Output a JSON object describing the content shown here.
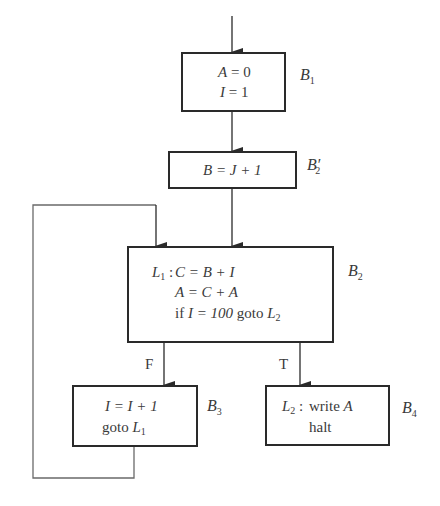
{
  "diagram": {
    "type": "control-flow-graph",
    "blocks": [
      {
        "id": "B1",
        "label": {
          "base": "B",
          "sub": "1",
          "prime": ""
        },
        "lines": [
          {
            "lhs": "A",
            "op": " = ",
            "rhs": "0"
          },
          {
            "lhs": "I",
            "op": " = ",
            "rhs": "1"
          }
        ]
      },
      {
        "id": "B2prime",
        "label": {
          "base": "B",
          "sub": "2",
          "prime": "′"
        },
        "lines": [
          {
            "text": "B = J + 1"
          }
        ]
      },
      {
        "id": "B2",
        "label": {
          "base": "B",
          "sub": "2",
          "prime": ""
        },
        "entry_label": {
          "base": "L",
          "sub": "1",
          "sep": " : "
        },
        "lines": [
          {
            "text": "C = B + I"
          },
          {
            "text": "A = C + A"
          },
          {
            "kw": "if ",
            "cond": "I = 100",
            "kw2": " goto ",
            "target": "L",
            "target_sub": "2"
          }
        ]
      },
      {
        "id": "B3",
        "label": {
          "base": "B",
          "sub": "3",
          "prime": ""
        },
        "lines": [
          {
            "text": "I = I + 1"
          },
          {
            "kw": "goto ",
            "target": "L",
            "target_sub": "1"
          }
        ]
      },
      {
        "id": "B4",
        "label": {
          "base": "B",
          "sub": "4",
          "prime": ""
        },
        "entry_label": {
          "base": "L",
          "sub": "2",
          "sep": " : "
        },
        "lines": [
          {
            "kw": "write ",
            "var": "A"
          },
          {
            "kw": "halt"
          }
        ]
      }
    ],
    "edges": [
      {
        "from": "entry",
        "to": "B1"
      },
      {
        "from": "B1",
        "to": "B2prime"
      },
      {
        "from": "B2prime",
        "to": "B2"
      },
      {
        "from": "B2",
        "to": "B3",
        "label": "F"
      },
      {
        "from": "B2",
        "to": "B4",
        "label": "T"
      },
      {
        "from": "B3",
        "to": "B2",
        "label": ""
      }
    ],
    "edge_labels": {
      "false": "F",
      "true": "T"
    },
    "colors": {
      "stroke": "#2a2a2a",
      "text": "#3a3a3a",
      "loop_stroke": "#6a6a6a"
    }
  }
}
